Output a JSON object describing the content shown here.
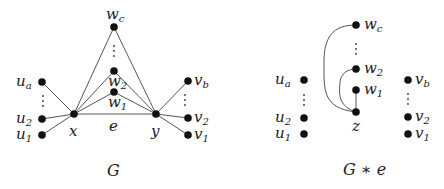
{
  "diagrams": [
    {
      "id": "G",
      "caption": "G",
      "nodes": {
        "wc": {
          "base": "w",
          "sub": "c"
        },
        "w2": {
          "base": "w",
          "sub": "2"
        },
        "w1": {
          "base": "w",
          "sub": "1"
        },
        "x": {
          "base": "x",
          "sub": ""
        },
        "y": {
          "base": "y",
          "sub": ""
        },
        "ua": {
          "base": "u",
          "sub": "a"
        },
        "u2": {
          "base": "u",
          "sub": "2"
        },
        "u1": {
          "base": "u",
          "sub": "1"
        },
        "vb": {
          "base": "v",
          "sub": "b"
        },
        "v2": {
          "base": "v",
          "sub": "2"
        },
        "v1": {
          "base": "v",
          "sub": "1"
        }
      },
      "edge_label": "e",
      "edges": [
        [
          "x",
          "y"
        ],
        [
          "x",
          "wc"
        ],
        [
          "x",
          "w2"
        ],
        [
          "x",
          "w1"
        ],
        [
          "y",
          "wc"
        ],
        [
          "y",
          "w2"
        ],
        [
          "y",
          "w1"
        ],
        [
          "x",
          "ua"
        ],
        [
          "x",
          "u2"
        ],
        [
          "x",
          "u1"
        ],
        [
          "y",
          "vb"
        ],
        [
          "y",
          "v2"
        ],
        [
          "y",
          "v1"
        ]
      ]
    },
    {
      "id": "G*e",
      "caption": "G ∗ e",
      "nodes": {
        "wc": {
          "base": "w",
          "sub": "c"
        },
        "w2": {
          "base": "w",
          "sub": "2"
        },
        "w1": {
          "base": "w",
          "sub": "1"
        },
        "z": {
          "base": "z",
          "sub": ""
        },
        "ua": {
          "base": "u",
          "sub": "a"
        },
        "u2": {
          "base": "u",
          "sub": "2"
        },
        "u1": {
          "base": "u",
          "sub": "1"
        },
        "vb": {
          "base": "v",
          "sub": "b"
        },
        "v2": {
          "base": "v",
          "sub": "2"
        },
        "v1": {
          "base": "v",
          "sub": "1"
        }
      },
      "edges": [
        [
          "z",
          "w1"
        ],
        [
          "z",
          "w2"
        ],
        [
          "z",
          "wc"
        ]
      ]
    }
  ]
}
